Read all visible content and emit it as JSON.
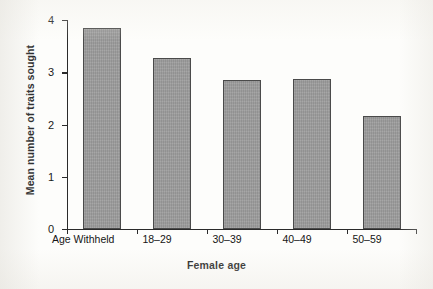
{
  "chart_data": {
    "type": "bar",
    "title": "",
    "subtitle": "",
    "xlabel": "Female age",
    "ylabel": "Mean number of traits sought",
    "categories": [
      "Age Withheld",
      "18–29",
      "30–39",
      "40–49",
      "50–59"
    ],
    "values": [
      3.85,
      3.27,
      2.85,
      2.88,
      2.17
    ],
    "series": [
      {
        "name": "Mean number of traits sought",
        "values": [
          3.85,
          3.27,
          2.85,
          2.88,
          2.17
        ]
      }
    ],
    "ylim": [
      0,
      4
    ],
    "yticks": [
      0,
      1,
      2,
      3,
      4
    ],
    "ytick_labels": [
      "0",
      "1",
      "2",
      "3",
      "4"
    ],
    "xlim_categories": 5,
    "grid": false,
    "legend": null,
    "legend_position": "none",
    "annotations": [],
    "colors": {
      "bar_fill": "#9b9b9b",
      "bar_border": "#4a4a4a",
      "axis": "#2a2a2a",
      "text": "#151515",
      "background": "#fdfdfb"
    }
  }
}
